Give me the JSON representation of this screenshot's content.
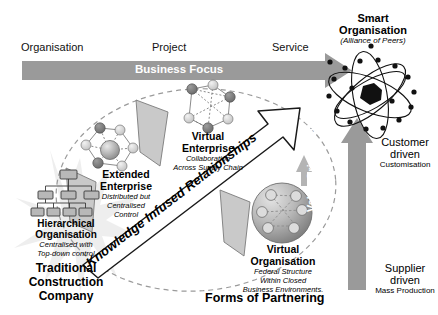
{
  "diagram": {
    "title_bottom": "Forms of Partnering",
    "business_focus": {
      "arrow_label": "Business Focus",
      "stages": [
        "Organisation",
        "Project",
        "Service"
      ],
      "arrow_color": "#9a9a9a",
      "label_color": "#ffffff"
    },
    "value_orientation": {
      "arrow_label": "Value Orientation",
      "arrow_color": "#9a9a9a",
      "top": {
        "line1": "Customer",
        "line2": "driven",
        "line3": "Customisation"
      },
      "bottom": {
        "line1": "Supplier",
        "line2": "driven",
        "line3": "Mass Production"
      }
    },
    "diagonal_arrow": {
      "label": "Knowledge Infused Relationships",
      "fill": "#ffffff",
      "stroke": "#1a1a1a"
    },
    "nodes": [
      {
        "id": "traditional",
        "icon": "org-chart-icon",
        "title_lines": [
          "Hierarchical",
          "Organisation"
        ],
        "sub_lines": [
          "Centralised with",
          "Top-down control"
        ],
        "caption_lines": [
          "Traditional",
          "Construction",
          "Company"
        ]
      },
      {
        "id": "extended-enterprise",
        "icon": "network-graph-icon",
        "title_lines": [
          "Extended",
          "Enterprise"
        ],
        "sub_lines": [
          "Distributed but",
          "Centralised",
          "Control"
        ],
        "caption_lines": []
      },
      {
        "id": "virtual-enterprise",
        "icon": "network-graph-icon",
        "title_lines": [
          "Virtual",
          "Enterprise"
        ],
        "sub_lines": [
          "Collaboration",
          "Across Supply Chain"
        ],
        "caption_lines": []
      },
      {
        "id": "virtual-organisation",
        "icon": "sphere-network-icon",
        "title_lines": [
          "Virtual",
          "Organisation"
        ],
        "sub_lines": [
          "Federal Structure",
          "Within Closed",
          "Business Environments."
        ],
        "caption_lines": []
      },
      {
        "id": "smart-organisation",
        "icon": "atom-icon",
        "title_lines": [
          "Smart",
          "Organisation"
        ],
        "sub_lines": [
          "(Alliance of Peers)"
        ],
        "caption_lines": []
      }
    ],
    "colors": {
      "grey_arrow": "#9a9a9a",
      "pennant_fill": "#c9c9c9",
      "pennant_stroke": "#6e6e6e",
      "dashed_ellipse": "#9a9a9a",
      "starburst": "#e6e6e6",
      "node_dark": "#7c7c7c",
      "node_light": "#d4d4d4",
      "ink": "#111111"
    }
  }
}
